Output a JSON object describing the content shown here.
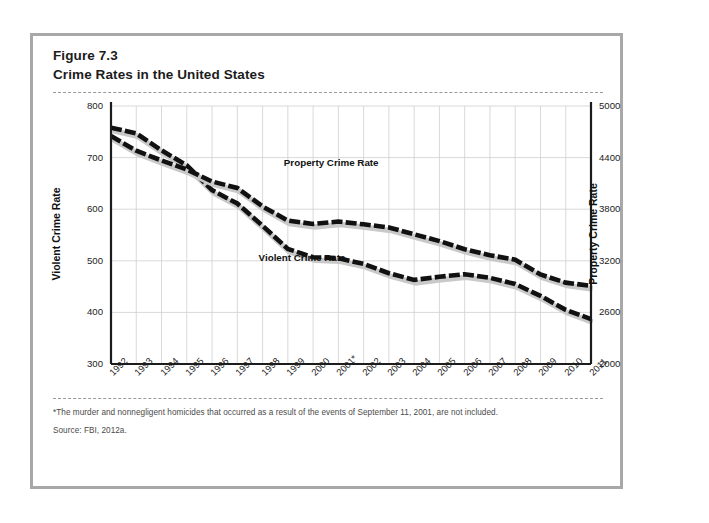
{
  "figure": {
    "number": "Figure 7.3",
    "title": "Crime Rates in the United States",
    "footnote": "*The murder and nonnegligent homicides that occurred as a result of the events of September 11, 2001, are not included.",
    "source": "Source: FBI, 2012a."
  },
  "chart_data": {
    "type": "line",
    "title": "Crime Rates in the United States",
    "xlabel": "",
    "ylabel": "Violent Crime Rate",
    "y2label": "Property Crime Rate",
    "grid": true,
    "legend_position": "inline-annotation",
    "ylim": [
      300,
      800
    ],
    "yticks": [
      300,
      400,
      500,
      600,
      700,
      800
    ],
    "y2lim": [
      2000,
      5000
    ],
    "y2ticks": [
      2000,
      2600,
      3200,
      3800,
      4400,
      5000
    ],
    "categories": [
      "1992",
      "1993",
      "1994",
      "1995",
      "1996",
      "1997",
      "1998",
      "1999",
      "2000",
      "2001*",
      "2002",
      "2003",
      "2004",
      "2005",
      "2006",
      "2007",
      "2008",
      "2009",
      "2010",
      "2011"
    ],
    "series": [
      {
        "name": "Violent Crime Rate",
        "axis": "left",
        "values": [
          758,
          747,
          714,
          685,
          637,
          611,
          568,
          523,
          507,
          505,
          494,
          476,
          463,
          469,
          474,
          467,
          455,
          432,
          405,
          387
        ]
      },
      {
        "name": "Property Crime Rate",
        "axis": "right",
        "values": [
          4650,
          4480,
          4367,
          4261,
          4122,
          4047,
          3832,
          3667,
          3629,
          3656,
          3624,
          3588,
          3508,
          3429,
          3335,
          3264,
          3213,
          3041,
          2946,
          2908
        ]
      }
    ]
  },
  "axes": {
    "left_ticks": [
      "800",
      "700",
      "600",
      "500",
      "400",
      "300"
    ],
    "right_ticks": [
      "5000",
      "4400",
      "3800",
      "3200",
      "2600",
      "2000"
    ],
    "left_title": "Violent Crime Rate",
    "right_title": "Property Crime Rate"
  },
  "annotations": {
    "property_label": "Property Crime Rate",
    "violent_label": "Violent Crime Rate"
  },
  "colors": {
    "line": "#111111",
    "shadow": "#c9c9c9",
    "grid": "#cfcfcf",
    "axis": "#1c1c1c",
    "frame": "#a8a8a8",
    "page": "#ffffff"
  }
}
